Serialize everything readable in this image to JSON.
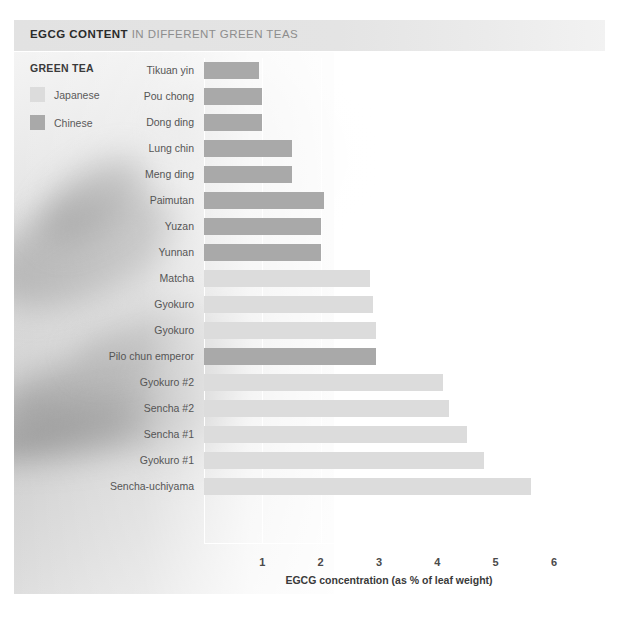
{
  "figure": {
    "title_strong": "EGCG CONTENT",
    "title_rest": " IN DIFFERENT GREEN TEAS",
    "figure_number": "Figure 26"
  },
  "legend": {
    "title": "GREEN TEA",
    "items": [
      {
        "label": "Japanese",
        "color": "#dcdcdc"
      },
      {
        "label": "Chinese",
        "color": "#a9a9a9"
      }
    ]
  },
  "colors": {
    "japanese": "#dcdcdc",
    "chinese": "#a9a9a9",
    "title_bar": "#e4e4e4",
    "grid": "#ffffff",
    "text": "#555555"
  },
  "chart_data": {
    "type": "bar",
    "orientation": "horizontal",
    "title": "EGCG CONTENT IN DIFFERENT GREEN TEAS",
    "xlabel": "EGCG concentration (as % of leaf weight)",
    "ylabel": "GREEN TEA",
    "xlim": [
      0,
      6
    ],
    "xticks": [
      1,
      2,
      3,
      4,
      5,
      6
    ],
    "xtick_labels": [
      "1",
      "2",
      "3",
      "4",
      "5",
      "6"
    ],
    "grid": "vertical",
    "legend_position": "top-left",
    "categories": [
      "Tikuan yin",
      "Pou chong",
      "Dong ding",
      "Lung chin",
      "Meng ding",
      "Paimutan",
      "Yuzan",
      "Yunnan",
      "Matcha",
      "Gyokuro",
      "Gyokuro",
      "Pilo chun emperor",
      "Gyokuro #2",
      "Sencha #2",
      "Sencha #1",
      "Gyokuro #1",
      "Sencha-uchiyama"
    ],
    "values": [
      0.95,
      1.0,
      1.0,
      1.5,
      1.5,
      2.05,
      2.0,
      2.0,
      2.85,
      2.9,
      2.95,
      2.95,
      4.1,
      4.2,
      4.5,
      4.8,
      5.6
    ],
    "groups": [
      "Chinese",
      "Chinese",
      "Chinese",
      "Chinese",
      "Chinese",
      "Chinese",
      "Chinese",
      "Chinese",
      "Japanese",
      "Japanese",
      "Japanese",
      "Chinese",
      "Japanese",
      "Japanese",
      "Japanese",
      "Japanese",
      "Japanese"
    ]
  }
}
